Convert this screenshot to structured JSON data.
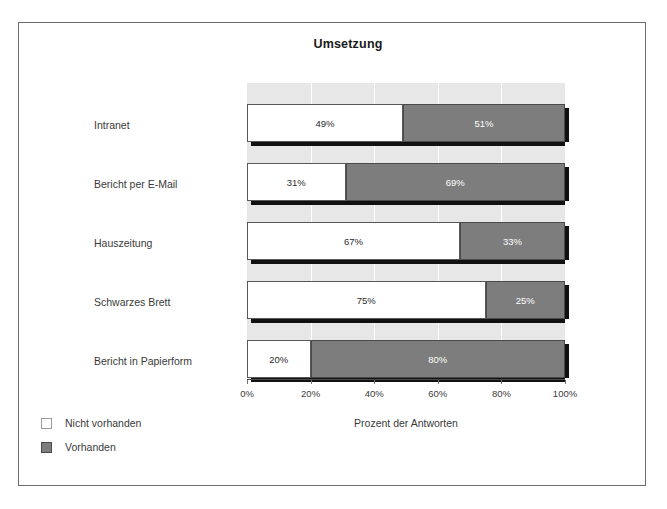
{
  "chart_data": {
    "type": "bar",
    "orientation": "horizontal",
    "stacked": true,
    "title": "Umsetzung",
    "xlabel": "Prozent der Antworten",
    "ylabel": "",
    "xlim": [
      0,
      100
    ],
    "xticks": [
      "0%",
      "20%",
      "40%",
      "60%",
      "80%",
      "100%"
    ],
    "xtick_values": [
      0,
      20,
      40,
      60,
      80,
      100
    ],
    "grid": "vertical-white-gridlines",
    "legend_position": "bottom-left",
    "categories": [
      "Intranet",
      "Bericht per E-Mail",
      "Hauszeitung",
      "Schwarzes Brett",
      "Bericht in Papierform"
    ],
    "series": [
      {
        "name": "Nicht vorhanden",
        "color": "#ffffff",
        "values": [
          49,
          31,
          67,
          75,
          20
        ],
        "labels": [
          "49%",
          "31%",
          "67%",
          "75%",
          "20%"
        ]
      },
      {
        "name": "Vorhanden",
        "color": "#7d7d7d",
        "values": [
          51,
          69,
          33,
          25,
          80
        ],
        "labels": [
          "51%",
          "69%",
          "33%",
          "25%",
          "80%"
        ]
      }
    ]
  },
  "colors": {
    "plot_background": "#e7e7e7",
    "gridline": "#ffffff",
    "frame_border": "#6b6b6b",
    "bar_white": "#ffffff",
    "bar_grey": "#7d7d7d",
    "shadow": "#111111",
    "text": "#3a3a3a"
  }
}
